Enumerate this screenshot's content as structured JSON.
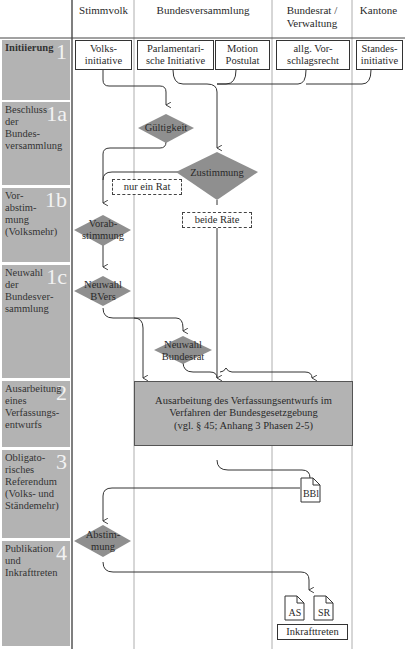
{
  "lanes": {
    "stimmvolk": "Stimmvolk",
    "bundesversammlung": "Bundesversammlung",
    "bundesrat": "Bundesrat / Verwaltung",
    "kantone": "Kantone"
  },
  "phases": [
    {
      "num": "1",
      "label": "Initiierung"
    },
    {
      "num": "1a",
      "label": "Beschluss der Bundes­versammlung"
    },
    {
      "num": "1b",
      "label": "Vor­abstim­mung (Volksmehr)"
    },
    {
      "num": "1c",
      "label": "Neu­wahl der Bundesver­sammlung"
    },
    {
      "num": "2",
      "label": "Ausar­beitung eines Verfassungs­entwurfs"
    },
    {
      "num": "3",
      "label": "Obligato­risches Referendum (Volks- und Ständemehr)"
    },
    {
      "num": "4",
      "label": "Publika­tion und Inkrafttreten"
    }
  ],
  "initiators": {
    "volks": "Volks- initiative",
    "parl": "Parlamentari- sche Initiative",
    "motion": "Motion Postulat",
    "vorschlag": "allg. Vor- schlagsrecht",
    "standes": "Standes- initiative"
  },
  "decisions": {
    "gueltigkeit": "Gültigkeit",
    "zustimmung": "Zustimmung",
    "vorabstimmung": "Vorab- stimmung",
    "neuwahl_bvers": "Neuwahl BVers",
    "neuwahl_bundesrat": "Neuwahl Bundesrat",
    "abstimmung": "Abstim- mung"
  },
  "conditions": {
    "nur_ein_rat": "nur ein Rat",
    "beide_raete": "beide Räte"
  },
  "process": {
    "ausarbeitung_line1": "Ausarbeitung des Verfassungsentwurfs im",
    "ausarbeitung_line2": "Verfahren der Bundesgesetzgebung",
    "ausarbeitung_line3": "(vgl. § 45; Anhang 3 Phasen 2-5)"
  },
  "documents": {
    "bbl": "BBl",
    "as": "AS",
    "sr": "SR"
  },
  "outcome": {
    "inkrafttreten": "Inkrafttreten"
  },
  "colors": {
    "label_bg": "#b3b3b3",
    "decision_fill": "#8f8f8f",
    "process_fill": "#b3b3b3",
    "line": "#333333",
    "phase_number": "#f2f2f2"
  }
}
